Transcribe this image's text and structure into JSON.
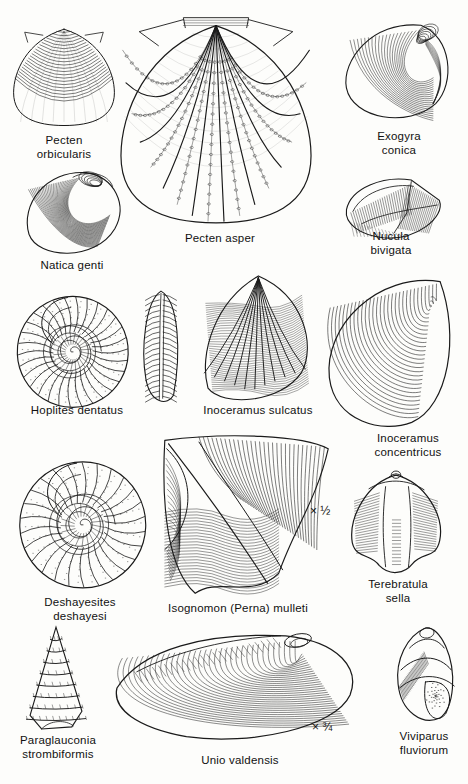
{
  "plate": {
    "title": "Cretaceous fossil plate",
    "background_color": "#fdfdfb",
    "ink_color": "#1a1a1a"
  },
  "figures": [
    {
      "id": "pecten-orbicularis",
      "caption": "Pecten\norbicularis",
      "kind": "bivalve-fan",
      "x": 8,
      "y": 18,
      "w": 112,
      "h": 112,
      "cap_x": 8,
      "cap_y": 134,
      "cap_w": 112
    },
    {
      "id": "pecten-asper",
      "caption": "Pecten asper",
      "kind": "scallop-large",
      "x": 120,
      "y": 14,
      "w": 192,
      "h": 212,
      "cap_x": 140,
      "cap_y": 232,
      "cap_w": 160
    },
    {
      "id": "exogyra-conica",
      "caption": "Exogyra\nconica",
      "kind": "oyster-conic",
      "x": 334,
      "y": 14,
      "w": 124,
      "h": 112,
      "cap_x": 340,
      "cap_y": 130,
      "cap_w": 118
    },
    {
      "id": "natica-genti",
      "caption": "Natica genti",
      "kind": "natica-snail",
      "x": 18,
      "y": 168,
      "w": 110,
      "h": 92,
      "cap_x": 8,
      "cap_y": 259,
      "cap_w": 128
    },
    {
      "id": "nucula-bivigata",
      "caption": "Nucula\nbivigata",
      "kind": "nucula",
      "x": 340,
      "y": 166,
      "w": 108,
      "h": 78,
      "cap_x": 336,
      "cap_y": 230,
      "cap_w": 110
    },
    {
      "id": "hoplites-dentatus",
      "caption": "Hoplites dentatus",
      "kind": "ammonite",
      "x": 14,
      "y": 286,
      "w": 118,
      "h": 122,
      "cap_x": 2,
      "cap_y": 404,
      "cap_w": 150
    },
    {
      "id": "hoplites-dentatus-edge",
      "caption": "",
      "kind": "ammonite-edge",
      "x": 140,
      "y": 290,
      "w": 42,
      "h": 114,
      "cap_x": 0,
      "cap_y": 0,
      "cap_w": 0
    },
    {
      "id": "inoceramus-sulcatus",
      "caption": "Inoceramus sulcatus",
      "kind": "inoceramus-sulcatus",
      "x": 196,
      "y": 272,
      "w": 120,
      "h": 132,
      "cap_x": 186,
      "cap_y": 404,
      "cap_w": 144
    },
    {
      "id": "inoceramus-concentricus",
      "caption": "Inoceramus\nconcentricus",
      "kind": "inoceramus-concentricus",
      "x": 318,
      "y": 272,
      "w": 142,
      "h": 160,
      "cap_x": 352,
      "cap_y": 432,
      "cap_w": 112
    },
    {
      "id": "deshayesites-deshayesi",
      "caption": "Deshayesites\ndeshayesi",
      "kind": "ammonite-2",
      "x": 16,
      "y": 446,
      "w": 134,
      "h": 146,
      "cap_x": 10,
      "cap_y": 596,
      "cap_w": 140
    },
    {
      "id": "isognomon-perna-mulleti",
      "caption": "Isognomon (Perna) mulleti",
      "kind": "isognomon",
      "x": 142,
      "y": 432,
      "w": 190,
      "h": 168,
      "cap_x": 140,
      "cap_y": 602,
      "cap_w": 196
    },
    {
      "id": "terebratula-sella",
      "caption": "Terebratula\nsella",
      "kind": "terebratula",
      "x": 344,
      "y": 470,
      "w": 104,
      "h": 104,
      "cap_x": 344,
      "cap_y": 578,
      "cap_w": 108
    },
    {
      "id": "paraglauconia-strombiformis",
      "caption": "Paraglauconia\nstrombiformis",
      "kind": "spire",
      "x": 20,
      "y": 626,
      "w": 72,
      "h": 104,
      "cap_x": 2,
      "cap_y": 734,
      "cap_w": 112
    },
    {
      "id": "unio-valdensis",
      "caption": "Unio  valdensis",
      "kind": "unio",
      "x": 112,
      "y": 630,
      "w": 248,
      "h": 116,
      "cap_x": 164,
      "cap_y": 754,
      "cap_w": 152
    },
    {
      "id": "viviparus-fluviorum",
      "caption": "Viviparus\nfluviorum",
      "kind": "viviparus",
      "x": 388,
      "y": 626,
      "w": 72,
      "h": 100,
      "cap_x": 380,
      "cap_y": 730,
      "cap_w": 88
    }
  ],
  "scale_marks": [
    {
      "id": "scale-half",
      "text": "× ½",
      "x": 310,
      "y": 504
    },
    {
      "id": "scale-three-quarters",
      "text": "× ¾",
      "x": 312,
      "y": 720
    }
  ]
}
